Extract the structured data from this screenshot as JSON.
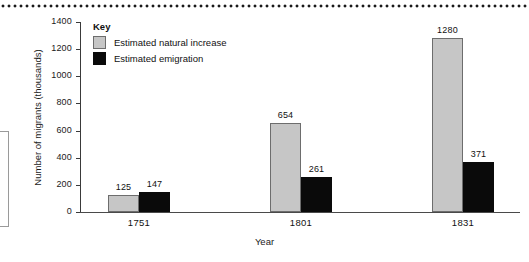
{
  "figure": {
    "top_rule": "dotted-rule",
    "side_box": "cropped-side-panel"
  },
  "legend": {
    "title": "Key",
    "entries": [
      {
        "label": "Estimated natural increase",
        "color": "#c6c6c6",
        "swatch": "natural-increase-swatch"
      },
      {
        "label": "Estimated emigration",
        "color": "#0a0a0a",
        "swatch": "emigration-swatch"
      }
    ]
  },
  "axes": {
    "y_title": "Number of migrants (thousands)",
    "x_title": "Year",
    "y_ticks": [
      "0",
      "200",
      "400",
      "600",
      "800",
      "1000",
      "1200",
      "1400"
    ]
  },
  "chart_data": {
    "type": "bar",
    "title": "",
    "subtitle": "",
    "xlabel": "Year",
    "ylabel": "Number of migrants (thousands)",
    "categories": [
      "1751",
      "1801",
      "1831"
    ],
    "series": [
      {
        "name": "Estimated natural increase",
        "color": "#c6c6c6",
        "values": [
          125,
          654,
          1280
        ]
      },
      {
        "name": "Estimated emigration",
        "color": "#0a0a0a",
        "values": [
          147,
          261,
          371
        ]
      }
    ],
    "value_labels": {
      "Estimated natural increase": [
        "125",
        "654",
        "1280"
      ],
      "Estimated emigration": [
        "147",
        "261",
        "371"
      ]
    },
    "ylim": [
      0,
      1400
    ],
    "ytick_step": 200,
    "grid": false,
    "legend_position": "inside-top-left"
  }
}
